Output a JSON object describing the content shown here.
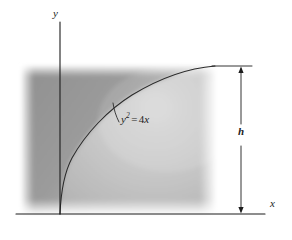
{
  "figure": {
    "axes": {
      "y_label": "y",
      "x_label": "x"
    },
    "curve": {
      "equation_base": "y",
      "equation_exponent": "2",
      "equation_operator": "=",
      "equation_rhs_coefficient": "4",
      "equation_rhs_variable": "x",
      "equation_plain": "y2 = 4x"
    },
    "dimension": {
      "height_label": "h"
    },
    "colors": {
      "shade_dark": "#8e8e8e",
      "shade_mid": "#a6a6a6",
      "shade_light": "#c9c9c9",
      "line": "#1d1d1d",
      "background": "#ffffff"
    }
  }
}
